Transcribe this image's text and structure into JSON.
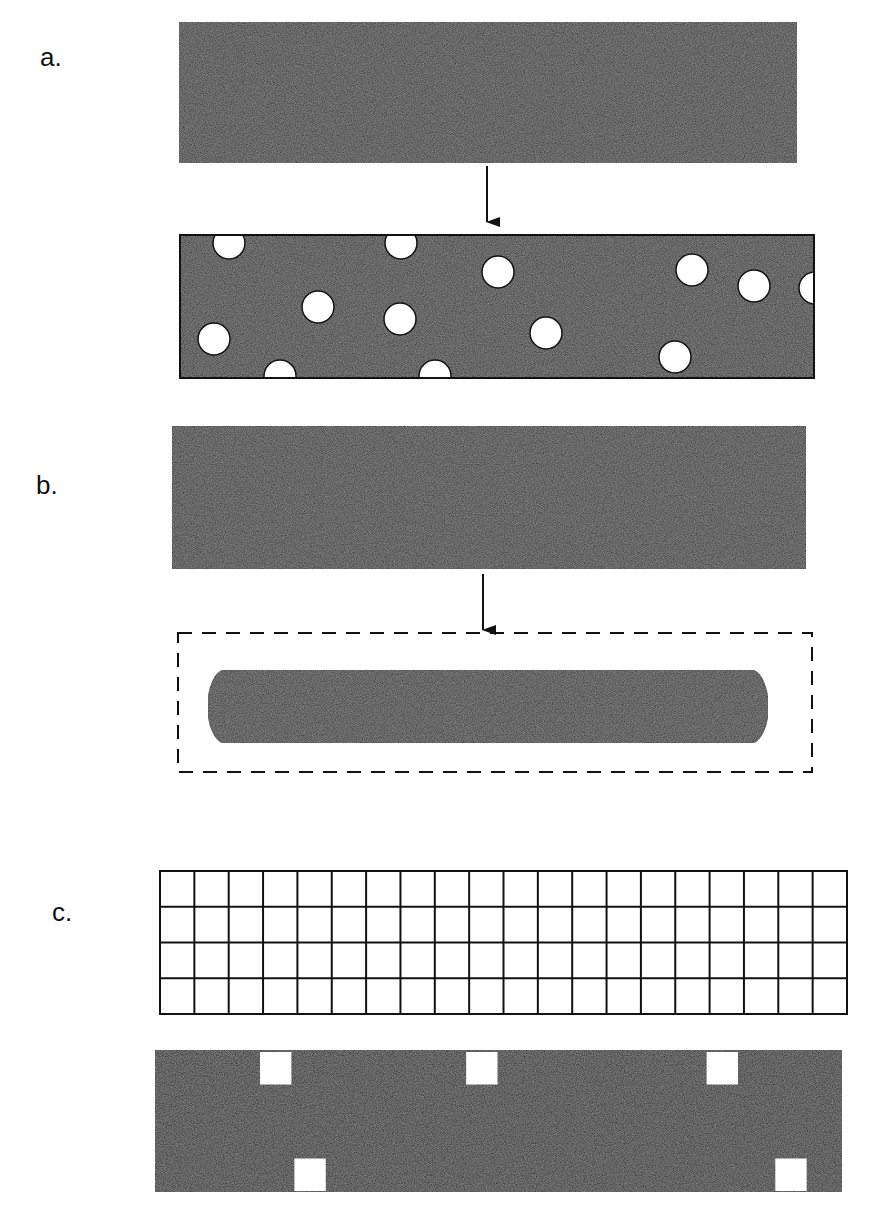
{
  "panels": {
    "a": {
      "label": "a.",
      "before": {
        "x": 179,
        "y": 22,
        "w": 618,
        "h": 141
      },
      "arrow": {
        "x": 487,
        "y1": 166,
        "y2": 222
      },
      "after": {
        "x": 180,
        "y": 235,
        "w": 634,
        "h": 143
      },
      "holes": [
        {
          "cx": 229,
          "cy": 243,
          "r": 16
        },
        {
          "cx": 401,
          "cy": 243,
          "r": 16
        },
        {
          "cx": 498,
          "cy": 272,
          "r": 16
        },
        {
          "cx": 318,
          "cy": 307,
          "r": 16
        },
        {
          "cx": 214,
          "cy": 339,
          "r": 16
        },
        {
          "cx": 400,
          "cy": 319,
          "r": 16
        },
        {
          "cx": 546,
          "cy": 333,
          "r": 16
        },
        {
          "cx": 280,
          "cy": 376,
          "r": 16
        },
        {
          "cx": 435,
          "cy": 376,
          "r": 16
        },
        {
          "cx": 692,
          "cy": 270,
          "r": 16
        },
        {
          "cx": 754,
          "cy": 286,
          "r": 16
        },
        {
          "cx": 815,
          "cy": 288,
          "r": 16
        },
        {
          "cx": 675,
          "cy": 357,
          "r": 16
        }
      ]
    },
    "b": {
      "label": "b.",
      "before": {
        "x": 172,
        "y": 426,
        "w": 634,
        "h": 143
      },
      "arrow": {
        "x": 483,
        "y1": 574,
        "y2": 630
      },
      "dashed_box": {
        "x": 178,
        "y": 633,
        "w": 634,
        "h": 139
      },
      "rounded_bar": {
        "x": 208,
        "y": 670,
        "w": 560,
        "h": 73
      }
    },
    "c": {
      "label": "c.",
      "grid": {
        "x": 160,
        "y": 871,
        "w": 687,
        "h": 143,
        "cols": 20,
        "rows": 4
      },
      "filled": {
        "x": 155,
        "y": 1050,
        "w": 687,
        "h": 142,
        "cols": 20,
        "rows": 4
      },
      "white_cells": [
        {
          "col": 3,
          "row": 0
        },
        {
          "col": 9,
          "row": 0
        },
        {
          "col": 16,
          "row": 0
        },
        {
          "col": 4,
          "row": 3
        },
        {
          "col": 18,
          "row": 3
        }
      ]
    }
  },
  "colors": {
    "fill_dark": "#2b2b2b",
    "fill_black": "#141414",
    "stroke": "#111111",
    "background": "#ffffff"
  }
}
